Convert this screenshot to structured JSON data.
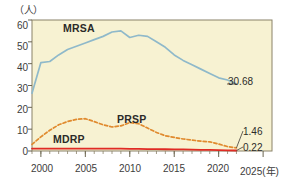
{
  "axes": {
    "unit_label": "（人）",
    "x_axis_unit": "(年)",
    "y_ticks": [
      "60",
      "50",
      "40",
      "30",
      "20",
      "10",
      "0"
    ],
    "x_ticks": [
      "2000",
      "2005",
      "2010",
      "2015",
      "2020",
      "2025"
    ],
    "ylim": [
      0,
      60
    ],
    "xlim": [
      1999,
      2026
    ]
  },
  "series_labels": {
    "mrsa": "MRSA",
    "prsp": "PRSP",
    "mdrp": "MDRP"
  },
  "endpoints": {
    "mrsa_value": "30.68",
    "prsp_value": "1.46",
    "mdrp_value": "0.22"
  },
  "colors": {
    "plot_background": "#f7f2d2",
    "plot_border": "#8a8268",
    "mrsa_line": "#8fb9ca",
    "prsp_line": "#e08a2e",
    "mdrp_line": "#e02b24",
    "text": "#3d3d3b"
  },
  "chart_data": {
    "type": "line",
    "title": "",
    "subtitle": "",
    "xlabel": "(年)",
    "ylabel": "（人）",
    "ylim": [
      0,
      60
    ],
    "xlim": [
      1999,
      2026
    ],
    "grid": false,
    "legend": "inline-labels",
    "x": [
      1999,
      2000,
      2001,
      2002,
      2003,
      2004,
      2005,
      2006,
      2007,
      2008,
      2009,
      2010,
      2011,
      2012,
      2013,
      2014,
      2015,
      2016,
      2017,
      2018,
      2019,
      2020,
      2021,
      2022
    ],
    "series": [
      {
        "name": "MRSA",
        "style": "solid",
        "color": "#8fb9ca",
        "values": [
          26.5,
          40.5,
          41.0,
          44.0,
          46.5,
          48.0,
          49.5,
          51.0,
          52.5,
          54.5,
          55.0,
          52.0,
          53.0,
          52.5,
          50.0,
          47.5,
          44.0,
          41.5,
          39.5,
          37.5,
          35.5,
          33.5,
          32.5,
          30.68
        ],
        "end_label": "30.68"
      },
      {
        "name": "PRSP",
        "style": "dashed",
        "color": "#e08a2e",
        "values": [
          3.0,
          6.5,
          9.5,
          12.0,
          13.5,
          14.5,
          14.8,
          13.5,
          12.0,
          11.0,
          11.5,
          13.0,
          12.5,
          10.5,
          8.5,
          7.0,
          6.2,
          5.5,
          5.0,
          4.5,
          4.2,
          3.2,
          2.0,
          1.46
        ],
        "end_label": "1.46"
      },
      {
        "name": "MDRP",
        "style": "solid",
        "color": "#e02b24",
        "values": [
          1.1,
          1.1,
          1.1,
          1.1,
          1.1,
          1.1,
          1.1,
          1.1,
          1.1,
          1.1,
          1.1,
          1.0,
          1.0,
          0.9,
          0.85,
          0.8,
          0.75,
          0.7,
          0.6,
          0.55,
          0.5,
          0.4,
          0.3,
          0.22
        ],
        "end_label": "0.22"
      }
    ]
  }
}
